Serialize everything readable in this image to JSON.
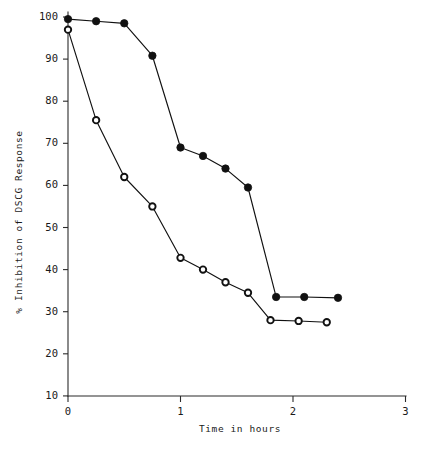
{
  "chart_data": {
    "type": "line",
    "title": "",
    "subtitle": "",
    "xlabel": "Time in hours",
    "ylabel": "% Inhibition of DSCG Response",
    "xlim": [
      0,
      3
    ],
    "ylim": [
      0,
      100
    ],
    "xticks": [
      0,
      1,
      2,
      3
    ],
    "xtick_labels": [
      "0",
      "1",
      "2",
      "3"
    ],
    "yticks": [
      10,
      20,
      30,
      40,
      50,
      60,
      70,
      80,
      90,
      100
    ],
    "ytick_labels": [
      "10",
      "20",
      "30",
      "40",
      "50",
      "60",
      "70",
      "80",
      "90",
      "100"
    ],
    "grid": false,
    "legend": "none",
    "legend_position": "none",
    "annotations": [],
    "series": [
      {
        "name": "filled-circle-series",
        "marker": "filled-circle",
        "color": "#111111",
        "x": [
          0.0,
          0.25,
          0.5,
          0.75,
          1.0,
          1.2,
          1.4,
          1.6,
          1.85,
          2.1,
          2.4
        ],
        "values": [
          99.5,
          99.0,
          98.5,
          90.8,
          69.0,
          67.0,
          64.0,
          59.5,
          33.5,
          33.5,
          33.3
        ]
      },
      {
        "name": "open-circle-series",
        "marker": "open-circle",
        "color": "#111111",
        "x": [
          0.0,
          0.25,
          0.5,
          0.75,
          1.0,
          1.2,
          1.4,
          1.6,
          1.8,
          2.05,
          2.3
        ],
        "values": [
          97.0,
          75.5,
          62.0,
          55.0,
          42.8,
          40.0,
          37.0,
          34.5,
          28.0,
          27.8,
          27.5
        ]
      }
    ]
  },
  "figure": {
    "background": "#ffffff",
    "axis_color": "#2b2b2b",
    "ink_color": "#111111"
  }
}
